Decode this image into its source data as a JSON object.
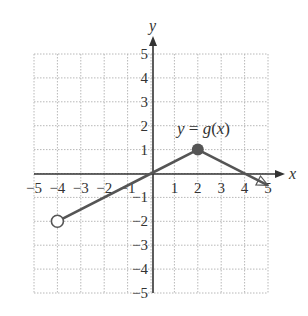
{
  "chart_data": {
    "type": "line",
    "title": "",
    "xlabel": "x",
    "ylabel": "y",
    "xlim": [
      -5,
      5
    ],
    "ylim": [
      -5,
      5
    ],
    "grid": true,
    "grid_style": "dotted",
    "x_ticks": [
      "-5",
      "-4",
      "-3",
      "-2",
      "-1",
      "1",
      "2",
      "3",
      "4",
      "5"
    ],
    "y_ticks": [
      "5",
      "4",
      "3",
      "2",
      "1",
      "-1",
      "-2",
      "-3",
      "-4",
      "-5"
    ],
    "series": [
      {
        "name": "y = g(x)",
        "points": [
          [
            -4,
            -2
          ],
          [
            0,
            0
          ],
          [
            2,
            1
          ],
          [
            5,
            -0.5
          ]
        ],
        "endpoints": [
          {
            "x": -4,
            "y": -2,
            "style": "open"
          },
          {
            "x": 2,
            "y": 1,
            "style": "filled"
          },
          {
            "x": 5,
            "y": -0.5,
            "style": "arrow"
          }
        ]
      }
    ],
    "annotations": [
      {
        "text": "y = g(x)",
        "x": 2,
        "y": 1.8
      }
    ]
  },
  "labels": {
    "x_axis": "x",
    "y_axis": "y",
    "function_y": "y",
    "function_eq": " = ",
    "function_g": "g",
    "function_open": "(",
    "function_x": "x",
    "function_close": ")"
  },
  "colors": {
    "curve": "#555555",
    "axis": "#333333",
    "grid": "#b8b8b8"
  }
}
